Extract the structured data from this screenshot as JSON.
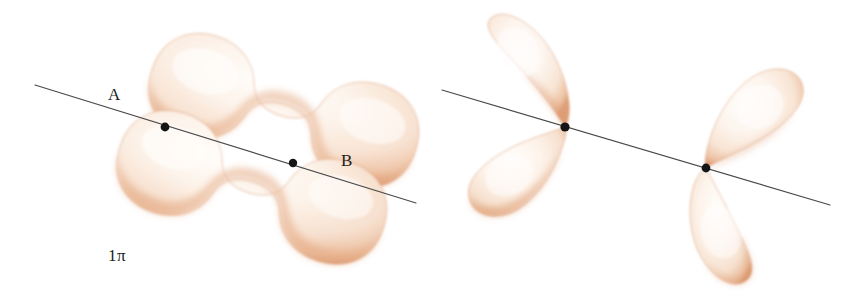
{
  "figure": {
    "kind": "molecular-orbital-diagram",
    "background_color": "#ffffff",
    "width": 865,
    "height": 294,
    "lobe_fill_light": "#fdf6ef",
    "lobe_fill_mid": "#f7e2d2",
    "lobe_fill_edge": "#e2a279",
    "lobe_stroke": "#d99b74",
    "axis_color": "#4a4a4a",
    "nucleus_color": "#151515",
    "text_color": "#231f20"
  },
  "panels": [
    {
      "id": "bonding",
      "caption": "1π",
      "caption_base": "1",
      "caption_symbol": "π",
      "caption_star": "",
      "description": "Bonding pi molecular orbital: two elongated peanut-shaped lobes, one above and one below the internuclear axis, each spanning both nuclei A and B",
      "lobe_count": 2,
      "atoms": [
        {
          "label": "A",
          "x": 165,
          "y": 127
        },
        {
          "label": "B",
          "x": 293,
          "y": 163
        }
      ],
      "axis": {
        "x1": 35,
        "y1": 85,
        "x2": 416,
        "y2": 203
      }
    },
    {
      "id": "antibonding",
      "caption": "1π*",
      "caption_base": "1",
      "caption_symbol": "π",
      "caption_star": "*",
      "description": "Antibonding pi molecular orbital: four teardrop lobes, two meeting at nucleus A and two meeting at nucleus B, with a nodal plane between the nuclei",
      "lobe_count": 4,
      "atoms": [
        {
          "label": "A",
          "x": 565,
          "y": 127
        },
        {
          "label": "B",
          "x": 706,
          "y": 168
        }
      ],
      "axis": {
        "x1": 442,
        "y1": 90,
        "x2": 830,
        "y2": 205
      }
    }
  ]
}
